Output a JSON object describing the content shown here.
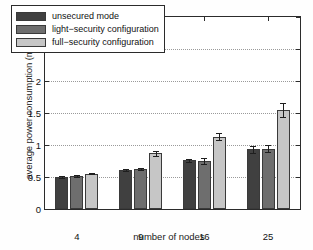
{
  "chart_data": {
    "type": "bar",
    "title": "",
    "xlabel": "number of nodes",
    "ylabel": "average power consumption (mW)",
    "categories": [
      "4",
      "9",
      "16",
      "25"
    ],
    "ylim": [
      0,
      3
    ],
    "yticks": [
      "0",
      "0.5",
      "1",
      "1.5",
      "2",
      "2.5",
      "3"
    ],
    "ytick_values": [
      0,
      0.5,
      1,
      1.5,
      2,
      2.5,
      3
    ],
    "grid": true,
    "legend_position": "upper left",
    "series": [
      {
        "name": "unsecured mode",
        "color": "#404040",
        "values": [
          0.5,
          0.61,
          0.76,
          0.93
        ],
        "errors": [
          0.01,
          0.015,
          0.025,
          0.055
        ]
      },
      {
        "name": "light-security configuration",
        "color": "#6e6e6e",
        "values": [
          0.52,
          0.62,
          0.75,
          0.94
        ],
        "errors": [
          0.015,
          0.015,
          0.05,
          0.055
        ]
      },
      {
        "name": "full-security configuration",
        "color": "#c6c6c6",
        "values": [
          0.55,
          0.87,
          1.13,
          1.55
        ],
        "errors": [
          0.01,
          0.035,
          0.055,
          0.11
        ]
      }
    ]
  },
  "legend": {
    "items": [
      {
        "label": "unsecured mode"
      },
      {
        "label": "light−security configuration"
      },
      {
        "label": "full−security configuration"
      }
    ]
  },
  "axes": {
    "ylabel": "average power consumption (mW)",
    "xlabel": "number of nodes"
  }
}
